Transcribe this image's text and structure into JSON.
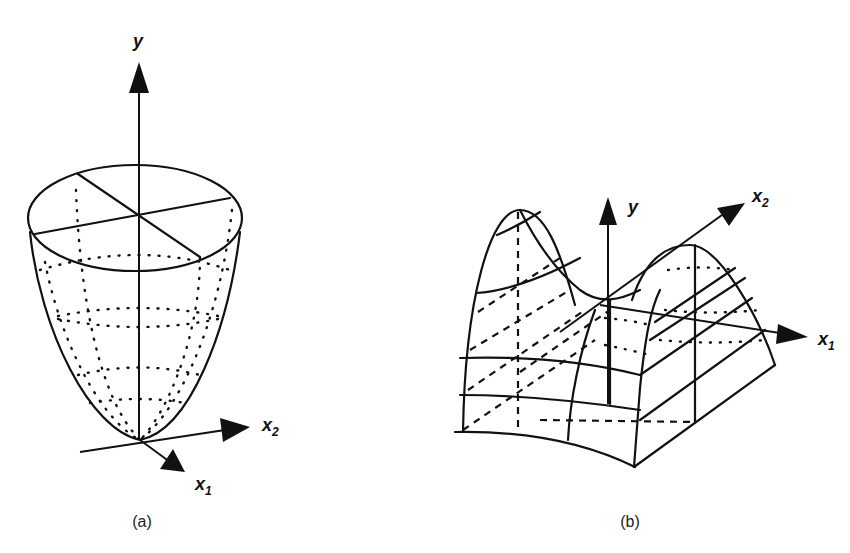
{
  "figure": {
    "panels": [
      {
        "id": "a",
        "caption": "(a)",
        "description": "Convex paraboloid bowl surface",
        "axes": {
          "vertical": "y",
          "x1": "x",
          "x1_sub": "1",
          "x2": "x",
          "x2_sub": "2"
        }
      },
      {
        "id": "b",
        "caption": "(b)",
        "description": "Saddle surface (hyperbolic paraboloid)",
        "axes": {
          "vertical": "y",
          "x1": "x",
          "x1_sub": "1",
          "x2": "x",
          "x2_sub": "2"
        }
      }
    ],
    "colors": {
      "ink": "#111111",
      "background": "#ffffff"
    }
  }
}
